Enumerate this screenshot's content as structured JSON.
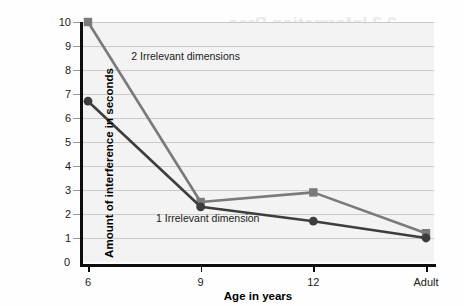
{
  "figure": {
    "background_color": "#fefefe",
    "plot_background_color": "#f3f3f3",
    "gridline_color": "#c9c9c9",
    "axis_color": "#0d0d0d"
  },
  "bleed_through": {
    "heading_1": "2.3 Information Proc",
    "heading_2": "Remembering",
    "body_1": "From Hunt's work on the relationsh",
    "body_2": "and the information-pro",
    "body_3": "important processes in",
    "body_4": "cognitive problem"
  },
  "chart_data": {
    "type": "line",
    "title": "",
    "xlabel": "Age in years",
    "ylabel": "Amount of interference in seconds",
    "categories": [
      "6",
      "9",
      "12",
      "Adult"
    ],
    "ylim": [
      0,
      10
    ],
    "yticks": [
      0,
      1,
      2,
      3,
      4,
      5,
      6,
      7,
      8,
      9,
      10
    ],
    "ytick_labels": [
      "0",
      "1",
      "2",
      "3",
      "4",
      "5",
      "6",
      "7",
      "8",
      "9",
      "10"
    ],
    "grid": true,
    "legend_position": "inline-annotations",
    "series": [
      {
        "name": "2 Irrelevant dimensions",
        "values": [
          10.0,
          2.5,
          2.9,
          1.2
        ],
        "color": "#7a7a7a",
        "marker": "square"
      },
      {
        "name": "1 Irrelevant dimension",
        "values": [
          6.7,
          2.3,
          1.7,
          1.0
        ],
        "color": "#3d3d3d",
        "marker": "circle"
      }
    ],
    "annotations": [
      {
        "text": "2 Irrelevant dimensions",
        "x_frac": 0.145,
        "y_value": 8.55
      },
      {
        "text": "1 Irrelevant dimension",
        "x_frac": 0.215,
        "y_value": 1.78
      }
    ]
  }
}
